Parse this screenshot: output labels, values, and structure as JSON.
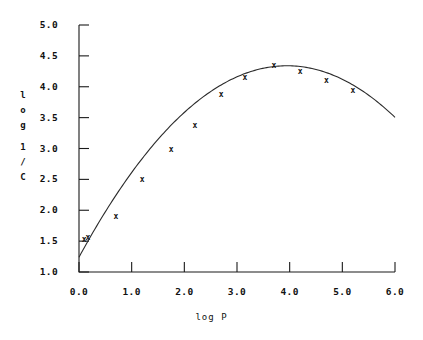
{
  "chart_data": {
    "type": "scatter",
    "title": "",
    "subtitle": "",
    "xlabel": "log P",
    "ylabel": "log 1/C",
    "ylabel_chars": [
      "l",
      "o",
      "g",
      "1",
      "/",
      "C"
    ],
    "xlim": [
      0.0,
      6.0
    ],
    "ylim": [
      1.0,
      5.0
    ],
    "xticks": [
      "0.0",
      "1.0",
      "2.0",
      "3.0",
      "4.0",
      "5.0",
      "6.0"
    ],
    "yticks": [
      "1.0",
      "1.5",
      "2.0",
      "2.5",
      "3.0",
      "3.5",
      "4.0",
      "4.5",
      "5.0"
    ],
    "grid": false,
    "legend": false,
    "marker_glyph": "x",
    "points": [
      {
        "x": 0.1,
        "y": 1.52
      },
      {
        "x": 0.17,
        "y": 1.56
      },
      {
        "x": 0.7,
        "y": 1.9
      },
      {
        "x": 1.2,
        "y": 2.5
      },
      {
        "x": 1.75,
        "y": 2.98
      },
      {
        "x": 2.2,
        "y": 3.37
      },
      {
        "x": 2.7,
        "y": 3.88
      },
      {
        "x": 3.15,
        "y": 4.15
      },
      {
        "x": 3.7,
        "y": 4.34
      },
      {
        "x": 4.2,
        "y": 4.25
      },
      {
        "x": 4.7,
        "y": 4.1
      },
      {
        "x": 5.2,
        "y": 3.94
      }
    ],
    "fit_curve": {
      "type": "parabola",
      "description": "downward parabola fitted through the points",
      "vertex": {
        "x": 3.95,
        "y": 4.34
      },
      "x_start": 0.0,
      "x_end": 6.0,
      "y_at_x_start": 1.24,
      "y_at_x_end": 3.32
    },
    "colors": {
      "axis": "#1a1a1a",
      "curve": "#2b2b2b",
      "marker": "#111111",
      "background": "#ffffff"
    }
  }
}
